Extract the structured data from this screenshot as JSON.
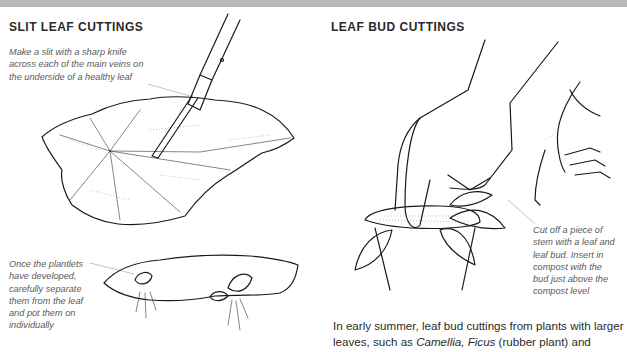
{
  "left_section": {
    "heading": "SLIT LEAF CUTTINGS",
    "caption_top": [
      "Make a slit with a sharp knife",
      "across each of the main veins on",
      "the underside of a healthy leaf"
    ],
    "caption_bottom": [
      "Once the plantlets",
      "have developed,",
      "carefully separate",
      "them from the leaf",
      "and pot them on",
      "individually"
    ],
    "illustrations": [
      "knife-slitting-leaf-illustration",
      "leaf-with-plantlets-illustration"
    ]
  },
  "right_section": {
    "heading": "LEAF BUD CUTTINGS",
    "caption": [
      "Cut off a piece of",
      "stem with a leaf and",
      "leaf bud. Insert in",
      "compost with the",
      "bud just above the",
      "compost level"
    ],
    "body": {
      "line1": "In early summer, leaf bud cuttings from plants with larger",
      "line2_pre": "leaves, such as ",
      "line2_em1": "Camellia, Ficus",
      "line2_post": " (rubber plant) and"
    },
    "illustrations": [
      "hand-inserting-cutting-in-pot-illustration",
      "hand-holding-stem-cutting-illustration"
    ]
  },
  "colors": {
    "topbar": "#b9b9b9",
    "heading": "#2a2a2a",
    "caption": "#5a5a5a",
    "body": "#2b2b2b"
  }
}
